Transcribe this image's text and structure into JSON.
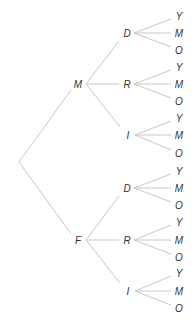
{
  "diagram": {
    "type": "tree",
    "orientation": "left-to-right",
    "root": {
      "label": "",
      "x": 19,
      "y": 162
    },
    "level1": [
      {
        "label": "M",
        "x": 78,
        "y": 84,
        "children": [
          {
            "label": "D",
            "x": 127,
            "y": 33,
            "children": [
              {
                "label": "Y",
                "x": 179,
                "y": 16
              },
              {
                "label": "M",
                "x": 179,
                "y": 33
              },
              {
                "label": "O",
                "x": 179,
                "y": 50
              }
            ]
          },
          {
            "label": "R",
            "x": 127,
            "y": 84,
            "children": [
              {
                "label": "Y",
                "x": 179,
                "y": 67
              },
              {
                "label": "M",
                "x": 179,
                "y": 84
              },
              {
                "label": "O",
                "x": 179,
                "y": 101
              }
            ]
          },
          {
            "label": "I",
            "x": 128,
            "y": 135,
            "children": [
              {
                "label": "Y",
                "x": 179,
                "y": 118
              },
              {
                "label": "M",
                "x": 179,
                "y": 135
              },
              {
                "label": "O",
                "x": 179,
                "y": 153
              }
            ]
          }
        ]
      },
      {
        "label": "F",
        "x": 78,
        "y": 240,
        "children": [
          {
            "label": "D",
            "x": 127,
            "y": 188,
            "children": [
              {
                "label": "Y",
                "x": 179,
                "y": 171
              },
              {
                "label": "M",
                "x": 179,
                "y": 188
              },
              {
                "label": "O",
                "x": 179,
                "y": 205
              }
            ]
          },
          {
            "label": "R",
            "x": 127,
            "y": 240,
            "children": [
              {
                "label": "Y",
                "x": 179,
                "y": 222
              },
              {
                "label": "M",
                "x": 179,
                "y": 240
              },
              {
                "label": "O",
                "x": 179,
                "y": 257
              }
            ]
          },
          {
            "label": "I",
            "x": 128,
            "y": 291,
            "children": [
              {
                "label": "Y",
                "x": 179,
                "y": 273
              },
              {
                "label": "M",
                "x": 179,
                "y": 291
              },
              {
                "label": "O",
                "x": 179,
                "y": 308
              }
            ]
          }
        ]
      }
    ],
    "colors": {
      "edge": "#c8c8c8",
      "label": "#333333",
      "background": "#ffffff"
    }
  }
}
